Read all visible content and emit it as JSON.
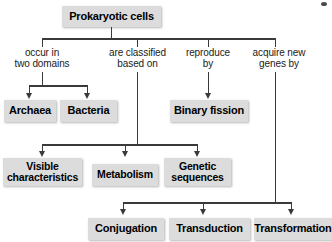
{
  "diagram": {
    "title": "Prokaryotic cells",
    "type": "hierarchy-flowchart",
    "root": {
      "label": "Prokaryotic cells"
    },
    "branch_labels": [
      {
        "name": "occur-in-two-domains",
        "label": "occur in\ntwo domains"
      },
      {
        "name": "are-classified-based-on",
        "label": "are classified\nbased on"
      },
      {
        "name": "reproduce-by",
        "label": "reproduce\nby"
      },
      {
        "name": "acquire-new-genes-by",
        "label": "acquire new\ngenes by"
      }
    ],
    "nodes": {
      "archaea": "Archaea",
      "bacteria": "Bacteria",
      "binary_fission": "Binary fission",
      "visible_characteristics": "Visible\ncharacteristics",
      "metabolism": "Metabolism",
      "genetic_sequences": "Genetic\nsequences",
      "conjugation": "Conjugation",
      "transduction": "Transduction",
      "transformation": "Transformation"
    },
    "colors": {
      "box_fill": "#dcdcdc",
      "line": "#3a3a3a",
      "text": "#000000",
      "background": "#ffffff"
    }
  }
}
